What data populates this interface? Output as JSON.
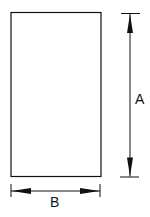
{
  "diagram": {
    "title": "",
    "shape": "rectangle",
    "dimensions": [
      {
        "id": "height",
        "label": "A",
        "orientation": "vertical"
      },
      {
        "id": "width",
        "label": "B",
        "orientation": "horizontal"
      }
    ],
    "colors": {
      "stroke": "#111111",
      "background": "#ffffff"
    }
  }
}
